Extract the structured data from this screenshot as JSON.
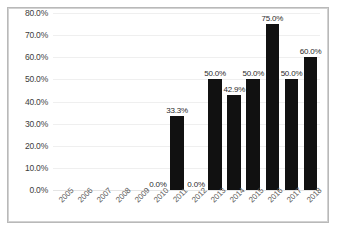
{
  "chart_data": {
    "type": "bar",
    "title": "",
    "xlabel": "",
    "ylabel": "",
    "ylim": [
      0,
      0.8
    ],
    "grid": true,
    "legend": false,
    "categories": [
      "2005",
      "2006",
      "2007",
      "2008",
      "2009",
      "2010",
      "2011",
      "2012",
      "2013",
      "2014",
      "2015",
      "2016",
      "2017",
      "2018"
    ],
    "values": [
      null,
      null,
      null,
      null,
      null,
      0.0,
      0.333,
      0.0,
      0.5,
      0.429,
      0.5,
      0.75,
      0.5,
      0.6
    ],
    "data_labels": [
      "",
      "",
      "",
      "",
      "",
      "0.0%",
      "33.3%",
      "0.0%",
      "50.0%",
      "42.9%",
      "50.0%",
      "75.0%",
      "50.0%",
      "60.0%"
    ],
    "ytick_labels": [
      "80.0%",
      "70.0%",
      "60.0%",
      "50.0%",
      "40.0%",
      "30.0%",
      "20.0%",
      "10.0%",
      "0.0%"
    ],
    "ytick_values": [
      0.8,
      0.7,
      0.6,
      0.5,
      0.4,
      0.3,
      0.2,
      0.1,
      0.0
    ],
    "bar_color": "#111111",
    "gridline_color": "#efefef",
    "axis_text_color": "#5c5c5c"
  }
}
